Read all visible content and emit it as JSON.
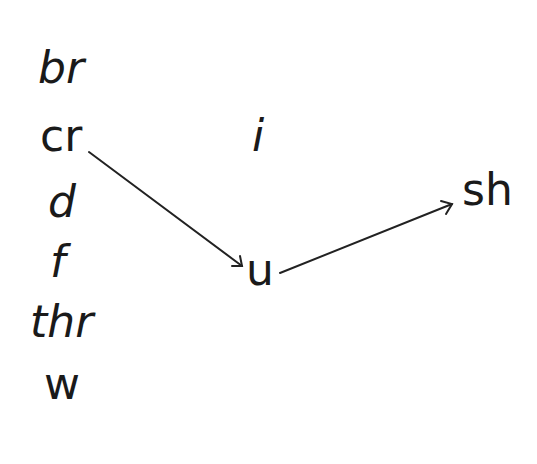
{
  "onsets": [
    "br",
    "cr",
    "d",
    "f",
    "thr",
    "w"
  ],
  "vowels": [
    "i",
    "u"
  ],
  "codas": [
    "sh"
  ],
  "arrows": [
    {
      "from": "cr",
      "to": "u"
    },
    {
      "from": "u",
      "to": "sh"
    }
  ],
  "colors": {
    "text": "#1a1a1a",
    "line": "#222222",
    "background": "#ffffff"
  }
}
